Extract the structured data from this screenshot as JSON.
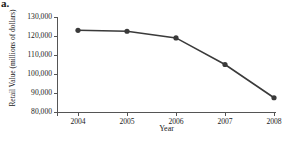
{
  "panel": {
    "letter": "a."
  },
  "chart_data": {
    "type": "line",
    "title": "",
    "xlabel": "Year",
    "ylabel": "Retail Value (millions of dollars)",
    "categories": [
      "2004",
      "2005",
      "2006",
      "2007",
      "2008"
    ],
    "values": [
      123000,
      122500,
      119000,
      105000,
      87500
    ],
    "series": [
      {
        "name": "Retail Value",
        "values": [
          123000,
          122500,
          119000,
          105000,
          87500
        ]
      }
    ],
    "ylim": [
      80000,
      130000
    ],
    "yticks": [
      "80,000",
      "90,000",
      "100,000",
      "110,000",
      "120,000",
      "130,000"
    ],
    "ytick_values": [
      80000,
      90000,
      100000,
      110000,
      120000,
      130000
    ],
    "xticks": [
      "2004",
      "2005",
      "2006",
      "2007",
      "2008"
    ],
    "grid": false,
    "legend": "none",
    "line_color": "#3a3a3a",
    "marker_color": "#3a3a3a",
    "marker_shape": "circle",
    "axis_color": "#555555"
  }
}
